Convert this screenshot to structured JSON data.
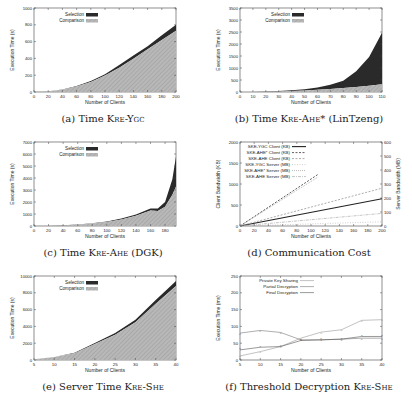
{
  "chart_data": [
    {
      "id": "a",
      "type": "area",
      "stacked": true,
      "caption_prefix": "(a) Time ",
      "caption_sc": "Kre-Ygc",
      "caption_suffix": "",
      "xlabel": "Number of Clients",
      "ylabel": "Execution Time (s)",
      "xlim": [
        0,
        200
      ],
      "ylim": [
        0,
        1000
      ],
      "xticks": [
        0,
        20,
        40,
        60,
        80,
        100,
        120,
        140,
        160,
        180,
        200
      ],
      "yticks": [
        0,
        200,
        400,
        600,
        800,
        1000
      ],
      "legend": [
        "Selection",
        "Comparison"
      ],
      "legend_position": "top-left",
      "x": [
        0,
        20,
        40,
        60,
        80,
        100,
        120,
        140,
        160,
        180,
        200
      ],
      "series": [
        {
          "name": "Comparison",
          "values": [
            0,
            8,
            28,
            65,
            120,
            195,
            290,
            395,
            510,
            620,
            730
          ]
        },
        {
          "name": "Selection",
          "values": [
            0,
            1,
            3,
            6,
            10,
            15,
            30,
            40,
            35,
            55,
            70
          ]
        }
      ]
    },
    {
      "id": "b",
      "type": "area",
      "stacked": true,
      "caption_prefix": "(b) Time ",
      "caption_sc": "Kre-Ahe*",
      "caption_suffix": " (LinTzeng)",
      "xlabel": "Number of Clients",
      "ylabel": "Execution Time (s)",
      "xlim": [
        0,
        110
      ],
      "ylim": [
        0,
        3500
      ],
      "xticks": [
        0,
        10,
        20,
        30,
        40,
        50,
        60,
        70,
        80,
        90,
        100,
        110
      ],
      "yticks": [
        0,
        500,
        1000,
        1500,
        2000,
        2500,
        3000,
        3500
      ],
      "legend": [
        "Selection",
        "Comparison"
      ],
      "legend_position": "top-left",
      "x": [
        0,
        10,
        20,
        30,
        40,
        50,
        60,
        70,
        80,
        90,
        100,
        110
      ],
      "series": [
        {
          "name": "Comparison",
          "values": [
            0,
            3,
            10,
            22,
            40,
            60,
            90,
            125,
            165,
            210,
            260,
            320
          ]
        },
        {
          "name": "Selection",
          "values": [
            0,
            2,
            6,
            15,
            30,
            55,
            100,
            180,
            300,
            650,
            1200,
            2150
          ]
        }
      ]
    },
    {
      "id": "c",
      "type": "area",
      "stacked": true,
      "caption_prefix": "(c) Time ",
      "caption_sc": "Kre-Ahe",
      "caption_suffix": " (DGK)",
      "xlabel": "Number of Clients",
      "ylabel": "Execution Time (s)",
      "xlim": [
        0,
        195
      ],
      "ylim": [
        0,
        7000
      ],
      "xticks": [
        0,
        20,
        40,
        60,
        80,
        100,
        120,
        140,
        160,
        180
      ],
      "yticks": [
        0,
        1000,
        2000,
        3000,
        4000,
        5000,
        6000,
        7000
      ],
      "legend": [
        "Selection",
        "Comparison"
      ],
      "legend_position": "top-left",
      "x": [
        0,
        20,
        40,
        60,
        80,
        100,
        120,
        140,
        160,
        170,
        180,
        190,
        195
      ],
      "series": [
        {
          "name": "Comparison",
          "values": [
            0,
            15,
            50,
            110,
            200,
            330,
            550,
            850,
            1300,
            1250,
            1600,
            2600,
            3300
          ]
        },
        {
          "name": "Selection",
          "values": [
            0,
            2,
            5,
            10,
            20,
            40,
            70,
            110,
            150,
            200,
            400,
            1300,
            2500
          ]
        }
      ]
    },
    {
      "id": "d",
      "type": "line",
      "caption_prefix": "(d) Communication Cost",
      "caption_sc": "",
      "caption_suffix": "",
      "xlabel": "Number of Clients",
      "ylabel": "Client Bandwidth (KB)",
      "y2label": "Server Bandwidth (MB)",
      "xlim": [
        0,
        200
      ],
      "ylim": [
        0,
        2000
      ],
      "y2lim": [
        0,
        600
      ],
      "xticks": [
        0,
        20,
        40,
        60,
        80,
        100,
        120,
        140,
        160,
        180,
        200
      ],
      "yticks": [
        0,
        500,
        1000,
        1500,
        2000
      ],
      "y2ticks": [
        0,
        100,
        200,
        300,
        400,
        500,
        600
      ],
      "legend": [
        "SKE-YGC Client (KB)",
        "SKE-AHE* Client (KB)",
        "SKE-AHE Client (KB)",
        "SKE-YGC Server (MB)",
        "SKE-AHE* Server (MB)",
        "SKE-AHE Server (MB)"
      ],
      "legend_position": "top-left",
      "series": [
        {
          "name": "SKE-YGC Client (KB)",
          "axis": "left",
          "x": [
            0,
            200
          ],
          "values": [
            0,
            650
          ],
          "style": "solid-thick"
        },
        {
          "name": "SKE-AHE* Client (KB)",
          "axis": "left",
          "x": [
            0,
            110
          ],
          "values": [
            0,
            1230
          ],
          "style": "dashed-dark"
        },
        {
          "name": "SKE-AHE Client (KB)",
          "axis": "left",
          "x": [
            0,
            200
          ],
          "values": [
            0,
            900
          ],
          "style": "dashed-gray"
        },
        {
          "name": "SKE-YGC Server (MB)",
          "axis": "right",
          "x": [
            0,
            200
          ],
          "values": [
            0,
            30
          ],
          "style": "dotted-light"
        },
        {
          "name": "SKE-AHE* Server (MB)",
          "axis": "right",
          "x": [
            0,
            110
          ],
          "values": [
            0,
            350
          ],
          "style": "dotted-gray"
        },
        {
          "name": "SKE-AHE Server (MB)",
          "axis": "right",
          "x": [
            0,
            200
          ],
          "values": [
            0,
            90
          ],
          "style": "dashdot-gray"
        }
      ]
    },
    {
      "id": "e",
      "type": "area",
      "stacked": true,
      "caption_prefix": "(e) Server Time ",
      "caption_sc": "Kre-She",
      "caption_suffix": "",
      "xlabel": "Number of Clients",
      "ylabel": "Execution Time (s)",
      "xlim": [
        5,
        40
      ],
      "ylim": [
        0,
        10000
      ],
      "xticks": [
        5,
        10,
        15,
        20,
        25,
        30,
        35,
        40
      ],
      "yticks": [
        0,
        2000,
        4000,
        6000,
        8000,
        10000
      ],
      "legend": [
        "Selection",
        "Comparison"
      ],
      "legend_position": "top-left",
      "x": [
        5,
        10,
        15,
        20,
        25,
        30,
        35,
        40
      ],
      "series": [
        {
          "name": "Comparison",
          "values": [
            80,
            350,
            800,
            1900,
            3000,
            4500,
            6700,
            8800
          ]
        },
        {
          "name": "Selection",
          "values": [
            5,
            20,
            50,
            120,
            200,
            300,
            450,
            600
          ]
        }
      ]
    },
    {
      "id": "f",
      "type": "line",
      "caption_prefix": "(f) Threshold Decryption ",
      "caption_sc": "Kre-She",
      "caption_suffix": "",
      "xlabel": "Number of Clients",
      "ylabel": "Execution Time (ms)",
      "xlim": [
        5,
        40
      ],
      "ylim": [
        0,
        250
      ],
      "xticks": [
        5,
        10,
        15,
        20,
        25,
        30,
        35,
        40
      ],
      "yticks": [
        0,
        50,
        100,
        150,
        200,
        250
      ],
      "legend": [
        "Private Key Sharing",
        "Partial Decryption",
        "Final Decryption"
      ],
      "legend_position": "top-left",
      "x": [
        5,
        10,
        15,
        20,
        25,
        30,
        35,
        40
      ],
      "series": [
        {
          "name": "Private Key Sharing",
          "values": [
            12,
            25,
            40,
            65,
            83,
            90,
            118,
            120
          ]
        },
        {
          "name": "Partial Decryption",
          "values": [
            80,
            88,
            82,
            60,
            60,
            62,
            65,
            65
          ]
        },
        {
          "name": "Final Decryption",
          "values": [
            30,
            38,
            40,
            58,
            60,
            62,
            70,
            70
          ]
        }
      ]
    }
  ],
  "captions": {
    "a": {
      "prefix": "(a) Time ",
      "sc": "Kre-Ygc",
      "suffix": ""
    },
    "b": {
      "prefix": "(b) Time ",
      "sc": "Kre-Ahe*",
      "suffix": " (LinTzeng)"
    },
    "c": {
      "prefix": "(c) Time ",
      "sc": "Kre-Ahe",
      "suffix": " (DGK)"
    },
    "d": {
      "prefix": "(d) Communication Cost",
      "sc": "",
      "suffix": ""
    },
    "e": {
      "prefix": "(e) Server Time ",
      "sc": "Kre-She",
      "suffix": ""
    },
    "f": {
      "prefix": "(f) Threshold Decryption ",
      "sc": "Kre-She",
      "suffix": ""
    }
  },
  "colors": {
    "selection": "#2a2a2a",
    "comparison": "#b8b8b8",
    "axis": "#444444",
    "text": "#222222"
  }
}
